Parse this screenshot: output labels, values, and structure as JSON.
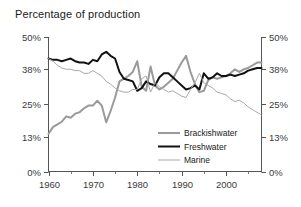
{
  "chart_data": {
    "type": "line",
    "title": "Percentage of production",
    "xlabel": "",
    "ylabel": "",
    "grid": false,
    "legend_position": "center-right-inside",
    "xlim": [
      1960,
      2008
    ],
    "ylim": [
      0,
      50
    ],
    "y_ticks": [
      0,
      13,
      25,
      38,
      50
    ],
    "y_tick_labels": [
      "0%",
      "13%",
      "25%",
      "38%",
      "50%"
    ],
    "dual_y_axis": true,
    "x_ticks_major": [
      1960,
      1970,
      1980,
      1990,
      2000
    ],
    "x_tick_labels": [
      "1960",
      "1970",
      "1980",
      "1990",
      "2000"
    ],
    "x_ticks_minor": [
      1965,
      1975,
      1985,
      1995,
      2005
    ],
    "x": [
      1960,
      1961,
      1962,
      1963,
      1964,
      1965,
      1966,
      1967,
      1968,
      1969,
      1970,
      1971,
      1972,
      1973,
      1974,
      1975,
      1976,
      1977,
      1978,
      1979,
      1980,
      1981,
      1982,
      1983,
      1984,
      1985,
      1986,
      1987,
      1988,
      1989,
      1990,
      1991,
      1992,
      1993,
      1994,
      1995,
      1996,
      1997,
      1998,
      1999,
      2000,
      2001,
      2002,
      2003,
      2004,
      2005,
      2006,
      2007,
      2008
    ],
    "series": [
      {
        "name": "Brackishwater",
        "color": "#9a9a9a",
        "width": 2.0,
        "values": [
          14.0,
          16.5,
          17.5,
          18.5,
          20.5,
          20.0,
          21.5,
          22.0,
          23.5,
          24.5,
          24.5,
          26.3,
          24.5,
          18.3,
          22.5,
          27.5,
          33.5,
          34.5,
          35.5,
          37.0,
          41.0,
          31.5,
          30.0,
          39.0,
          32.0,
          30.5,
          31.5,
          33.0,
          34.5,
          37.5,
          40.5,
          43.0,
          37.0,
          32.5,
          29.5,
          30.0,
          34.0,
          35.0,
          34.5,
          35.0,
          35.5,
          36.5,
          38.0,
          37.0,
          38.0,
          38.5,
          39.5,
          40.5,
          40.5
        ]
      },
      {
        "name": "Freshwater",
        "color": "#111111",
        "width": 2.0,
        "values": [
          42.0,
          41.5,
          41.5,
          41.0,
          41.5,
          42.0,
          41.0,
          40.5,
          40.5,
          40.0,
          41.5,
          41.0,
          43.5,
          44.5,
          43.0,
          42.0,
          37.0,
          34.5,
          34.0,
          33.5,
          30.0,
          31.0,
          33.5,
          32.5,
          32.0,
          35.0,
          36.5,
          36.5,
          35.0,
          33.5,
          32.0,
          30.5,
          31.0,
          32.0,
          30.5,
          36.5,
          34.5,
          35.0,
          36.5,
          35.5,
          35.5,
          36.0,
          35.5,
          36.0,
          36.5,
          37.5,
          38.0,
          38.5,
          38.5
        ]
      },
      {
        "name": "Marine",
        "color": "#a8a8a8",
        "width": 1.0,
        "values": [
          42.0,
          41.0,
          39.5,
          38.5,
          38.0,
          38.0,
          37.5,
          37.5,
          36.5,
          36.5,
          37.5,
          36.5,
          35.5,
          33.5,
          32.5,
          31.0,
          30.0,
          29.5,
          29.5,
          30.5,
          30.5,
          34.5,
          35.5,
          29.5,
          33.0,
          31.5,
          30.5,
          29.5,
          30.0,
          29.0,
          28.0,
          27.5,
          30.5,
          33.0,
          36.5,
          33.0,
          32.0,
          31.0,
          29.5,
          29.0,
          28.5,
          27.0,
          26.0,
          26.5,
          25.5,
          24.0,
          23.0,
          22.0,
          21.0
        ]
      }
    ]
  },
  "legend": {
    "items": [
      {
        "label": "Brackishwater"
      },
      {
        "label": "Freshwater"
      },
      {
        "label": "Marine"
      }
    ]
  },
  "axes": {
    "left_labels": [
      "50%",
      "38%",
      "25%",
      "13%",
      "0%"
    ],
    "right_labels": [
      "50%",
      "38%",
      "25%",
      "13%",
      "0%"
    ],
    "bottom_labels": [
      "1960",
      "1970",
      "1980",
      "1990",
      "2000"
    ]
  }
}
